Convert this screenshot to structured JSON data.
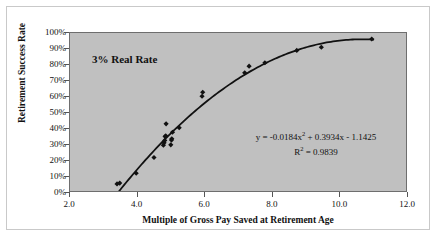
{
  "chart": {
    "annotation": "3% Real Rate",
    "equation_line1_prefix": "y = -0.0184x",
    "equation_line1_sup": "2",
    "equation_line1_suffix": " + 0.3934x - 1.1425",
    "equation_line2_prefix": "R",
    "equation_line2_sup": "2",
    "equation_line2_suffix": " = 0.9839",
    "plot_background": "#c0c0c0",
    "marker_color": "#111111",
    "trendline_color": "#111111",
    "frame_color": "#6e6e6e"
  },
  "chart_data": {
    "type": "scatter",
    "title": "",
    "subtitle": "",
    "xlabel": "Multiple of Gross Pay Saved at Retirement Age",
    "ylabel": "Retirement Success Rate",
    "xlim": [
      2.0,
      12.0
    ],
    "ylim": [
      0,
      1.0
    ],
    "xticks": [
      2.0,
      4.0,
      6.0,
      8.0,
      10.0,
      12.0
    ],
    "xtick_labels": [
      "2.0",
      "4.0",
      "6.0",
      "8.0",
      "10.0",
      "12.0"
    ],
    "yticks": [
      0,
      0.1,
      0.2,
      0.3,
      0.4,
      0.5,
      0.6,
      0.7,
      0.8,
      0.9,
      1.0
    ],
    "ytick_labels": [
      "0%",
      "10%",
      "20%",
      "30%",
      "40%",
      "50%",
      "60%",
      "70%",
      "80%",
      "90%",
      "100%"
    ],
    "grid": false,
    "legend": false,
    "legend_position": "none",
    "annotations": [
      {
        "text": "3% Real Rate",
        "x": 3.2,
        "y": 0.84
      },
      {
        "text": "y = -0.0184x^2 + 0.3934x - 1.1425",
        "x": 8.1,
        "y": 0.345
      },
      {
        "text": "R^2 = 0.9839",
        "x": 8.6,
        "y": 0.255
      }
    ],
    "series": [
      {
        "name": "Retirement success rate observations",
        "marker": "diamond",
        "points": [
          {
            "x": 3.4,
            "y": 0.045
          },
          {
            "x": 3.48,
            "y": 0.05
          },
          {
            "x": 3.97,
            "y": 0.112
          },
          {
            "x": 4.5,
            "y": 0.212
          },
          {
            "x": 4.78,
            "y": 0.29
          },
          {
            "x": 4.8,
            "y": 0.305
          },
          {
            "x": 4.82,
            "y": 0.32
          },
          {
            "x": 4.83,
            "y": 0.345
          },
          {
            "x": 4.85,
            "y": 0.35
          },
          {
            "x": 4.86,
            "y": 0.425
          },
          {
            "x": 5.0,
            "y": 0.292
          },
          {
            "x": 5.02,
            "y": 0.322
          },
          {
            "x": 5.03,
            "y": 0.33
          },
          {
            "x": 5.05,
            "y": 0.372
          },
          {
            "x": 5.25,
            "y": 0.4
          },
          {
            "x": 5.93,
            "y": 0.6
          },
          {
            "x": 5.95,
            "y": 0.625
          },
          {
            "x": 7.2,
            "y": 0.748
          },
          {
            "x": 7.33,
            "y": 0.79
          },
          {
            "x": 7.8,
            "y": 0.812
          },
          {
            "x": 8.75,
            "y": 0.89
          },
          {
            "x": 9.48,
            "y": 0.91
          },
          {
            "x": 10.98,
            "y": 0.962
          }
        ]
      }
    ],
    "trendline": {
      "type": "polynomial",
      "degree": 2,
      "equation": "y = -0.0184x^2 + 0.3934x - 1.1425",
      "r_squared": 0.9839,
      "coefficients": {
        "a": -0.0184,
        "b": 0.3934,
        "c": -1.1425
      },
      "x_range": [
        3.35,
        11.05
      ]
    }
  }
}
